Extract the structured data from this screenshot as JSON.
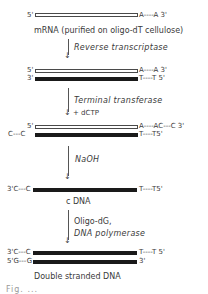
{
  "diagram": {
    "steps": [
      {
        "id": "mrna",
        "strands": [
          {
            "type": "hollow",
            "left_label": "5'",
            "right_label": "A----A 3'"
          }
        ],
        "caption": "mRNA (purified on oligo-dT cellulose)"
      },
      {
        "id": "reverse-transcription",
        "arrow_labels": [
          "Reverse transcriptase"
        ],
        "strands": [
          {
            "type": "hollow",
            "left_label": "5'",
            "right_label": "A----A 3'"
          },
          {
            "type": "solid",
            "left_label": "3'",
            "right_label": "T----T 5'"
          }
        ]
      },
      {
        "id": "tailing",
        "arrow_labels": [
          "Terminal transferase",
          "+ dCTP"
        ],
        "strands": [
          {
            "type": "hollow",
            "left_label": "5'",
            "right_label": "A----AC---C 3'"
          },
          {
            "type": "solid",
            "left_label": "C---C",
            "right_label": "T----T5'"
          }
        ]
      },
      {
        "id": "hydrolysis",
        "arrow_labels": [
          "NaOH"
        ],
        "strands": [
          {
            "type": "solid",
            "left_label": "3'C---C",
            "right_label": "T----T5'"
          }
        ],
        "caption": "c DNA"
      },
      {
        "id": "second-strand",
        "arrow_labels": [
          "Oligo-dG,",
          "DNA polymerase"
        ],
        "strands": [
          {
            "type": "solid",
            "left_label": "3'C---C",
            "right_label": "T----T 5'"
          },
          {
            "type": "solid",
            "left_label": "5'G---G",
            "right_label": "3'"
          }
        ],
        "caption": "Double stranded DNA"
      }
    ],
    "footer_partial_text": "Fig. ..."
  }
}
